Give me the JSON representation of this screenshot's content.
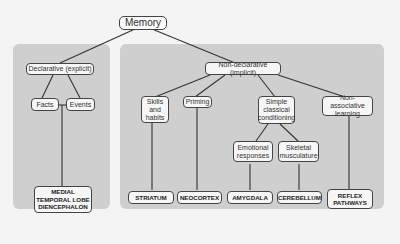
{
  "diagram": {
    "root": "Memory",
    "declarative": {
      "label": "Declarative (explicit)",
      "children": [
        "Facts",
        "Events"
      ],
      "structure": "MEDIAL\nTEMPORAL LOBE\nDIENCEPHALON"
    },
    "nondeclarative": {
      "label": "Non-declarative (implicit)",
      "categories": [
        {
          "label": "Skills\nand\nhabits",
          "structure": "STRIATUM"
        },
        {
          "label": "Priming",
          "structure": "NEOCORTEX"
        },
        {
          "label": "Simple\nclassical\nconditioning",
          "children": [
            {
              "label": "Emotional\nresponses",
              "structure": "AMYGDALA"
            },
            {
              "label": "Skeletal\nmusculature",
              "structure": "CEREBELLUM"
            }
          ]
        },
        {
          "label": "Non-associative\nlearning",
          "structure": "REFLEX\nPATHWAYS"
        }
      ]
    }
  }
}
